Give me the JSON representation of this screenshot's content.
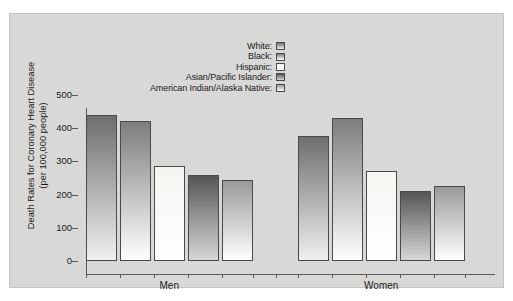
{
  "chart_data": {
    "type": "bar",
    "title": "",
    "xlabel": "",
    "ylabel": "Death Rates for Coronary Heart Disease (per 100,000 people)",
    "ylabel_line1": "Death Rates for Coronary Heart Disease",
    "ylabel_line2": "(per 100,000 people)",
    "categories": [
      "Men",
      "Women"
    ],
    "ylim": [
      0,
      500
    ],
    "yticks": [
      0,
      100,
      200,
      300,
      400,
      500
    ],
    "ytick_labels": [
      "0",
      "100",
      "200",
      "300",
      "400",
      "500"
    ],
    "grid": false,
    "legend_position": "top-right",
    "series": [
      {
        "name": "White",
        "label": "White:",
        "color": "#6e6e6e",
        "values": [
          440,
          378
        ]
      },
      {
        "name": "Black",
        "label": "Black:",
        "color": "#7d7d7d",
        "values": [
          422,
          431
        ]
      },
      {
        "name": "Hispanic",
        "label": "Hispanic:",
        "color": "#f5f5f2",
        "values": [
          287,
          270
        ]
      },
      {
        "name": "Asian/Pacific Islander",
        "label": "Asian/Pacific Islander:",
        "color": "#555555",
        "values": [
          259,
          211
        ]
      },
      {
        "name": "American Indian/Alaska Native",
        "label": "American Indian/Alaska Native:",
        "color": "#9a9a9a",
        "values": [
          243,
          227
        ]
      }
    ]
  },
  "legend": {
    "items": [
      {
        "label": "White:"
      },
      {
        "label": "Black:"
      },
      {
        "label": "Hispanic:"
      },
      {
        "label": "Asian/Pacific Islander:"
      },
      {
        "label": "American Indian/Alaska Native:"
      }
    ]
  },
  "colors": {
    "panel_background": "#d8d8d6",
    "axis": "#5a5a5a",
    "text": "#1a1a1a",
    "bar_edge": "#4a4a4a"
  }
}
